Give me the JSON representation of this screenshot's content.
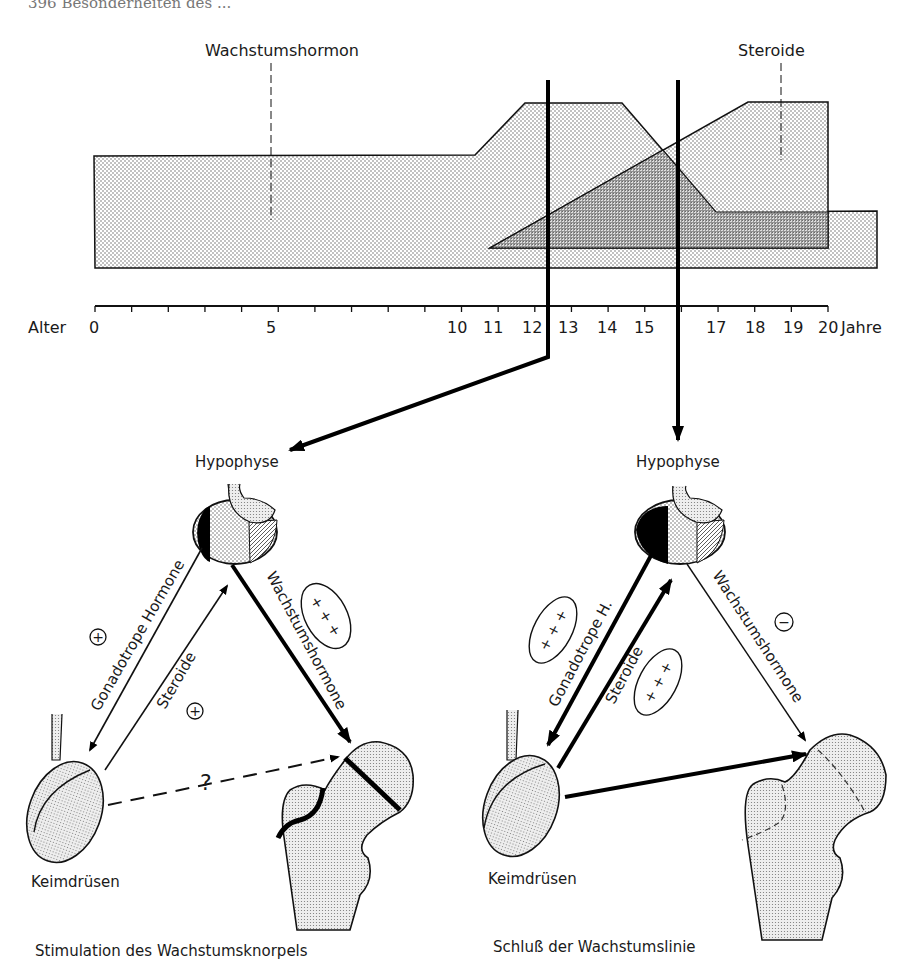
{
  "page_header": "396   Besonderheiten des ...",
  "timeline": {
    "axis_label": "Alter",
    "unit_label": "Jahre",
    "ticks": [
      "0",
      "5",
      "10",
      "11",
      "12",
      "13",
      "14",
      "15",
      "17",
      "18",
      "19",
      "20"
    ],
    "series": [
      {
        "name": "Wachstumshormon",
        "profile_years": [
          0,
          10.5,
          11.5,
          14.5,
          16.5,
          22
        ],
        "relative_level": [
          0.55,
          0.55,
          0.9,
          0.9,
          0.2,
          0.2
        ]
      },
      {
        "name": "Steroide",
        "profile_years": [
          11,
          18,
          20
        ],
        "relative_level": [
          0,
          0.9,
          0.9
        ]
      }
    ],
    "markers_years": [
      12.5,
      16
    ]
  },
  "diagrams": [
    {
      "pituitary_label": "Hypophyse",
      "gonad_label": "Keimdrüsen",
      "arrow_gonadotropic": "Gonadotrope Hormone",
      "arrow_steroids": "Steroide",
      "arrow_growth_hormone": "Wachstumshormone",
      "sign_gonadotropic": "+",
      "sign_steroids": "+",
      "sign_growth_hormone": "+ + +",
      "question": "?",
      "caption": "Stimulation des Wachstumsknorpels"
    },
    {
      "pituitary_label": "Hypophyse",
      "gonad_label": "Keimdrüsen",
      "arrow_gonadotropic": "Gonadotrope H.",
      "arrow_steroids": "Steroide",
      "arrow_growth_hormone": "Wachstumshormone",
      "sign_gonadotropic": "+ + +",
      "sign_steroids": "+ + +",
      "sign_growth_hormone": "−",
      "caption": "Schluß der Wachstumslinie"
    }
  ]
}
